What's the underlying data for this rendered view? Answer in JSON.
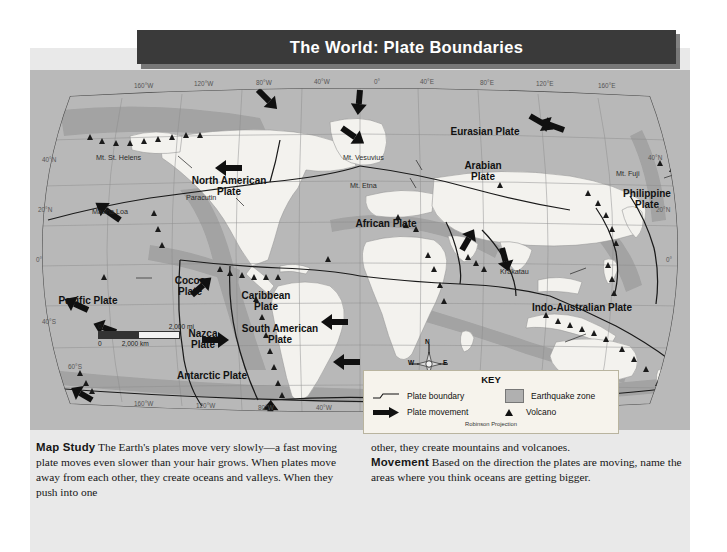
{
  "title": "The World: Plate Boundaries",
  "map": {
    "projection_note": "Robinson Projection",
    "plates": [
      {
        "name": "North American\nPlate",
        "x": 196,
        "y": 136
      },
      {
        "name": "Pacific Plate",
        "x": 56,
        "y": 228
      },
      {
        "name": "Cocos\nPlate",
        "x": 166,
        "y": 215
      },
      {
        "name": "Caribbean\nPlate",
        "x": 240,
        "y": 230
      },
      {
        "name": "Nazca\nPlate",
        "x": 181,
        "y": 266
      },
      {
        "name": "South American\nPlate",
        "x": 249,
        "y": 261
      },
      {
        "name": "African Plate",
        "x": 358,
        "y": 224
      },
      {
        "name": "Eurasian Plate",
        "x": 455,
        "y": 132
      },
      {
        "name": "Arabian\nPlate",
        "x": 455,
        "y": 169
      },
      {
        "name": "Philippine\nPlate",
        "x": 618,
        "y": 193
      },
      {
        "name": "Indo-Australian Plate",
        "x": 526,
        "y": 295
      },
      {
        "name": "Antarctic Plate",
        "x": 173,
        "y": 374
      }
    ],
    "volcano_labels": [
      {
        "name": "Mt. St. Helens",
        "x": 98,
        "y": 152
      },
      {
        "name": "Mauna Loa",
        "x": 96,
        "y": 207
      },
      {
        "name": "Paracutin",
        "x": 186,
        "y": 194
      },
      {
        "name": "Mt. Vesuvius",
        "x": 347,
        "y": 152
      },
      {
        "name": "Mt. Etna",
        "x": 353,
        "y": 181
      },
      {
        "name": "Mt. Fuji",
        "x": 617,
        "y": 169
      },
      {
        "name": "Krakatau",
        "x": 506,
        "y": 269
      }
    ],
    "longitude_top": [
      "160°W",
      "120°W",
      "80°W",
      "40°W",
      "0°",
      "40°E",
      "80°E",
      "120°E",
      "160°E"
    ],
    "longitude_bottom": [
      "160°W",
      "120°W",
      "80°W",
      "40°W"
    ],
    "latitude_left": [
      "40°N",
      "20°N",
      "0°",
      "40°S",
      "60°S"
    ],
    "latitude_right": [
      "40°N",
      "20°N",
      "0°"
    ],
    "compass": {
      "n": "N",
      "s": "S",
      "e": "E",
      "w": "W"
    },
    "scale": {
      "miles_zero": "0",
      "miles_value": "2,000 mi",
      "km_zero": "0",
      "km_value": "2,000 km"
    }
  },
  "key": {
    "title": "KEY",
    "items": [
      {
        "label": "Plate boundary",
        "icon": "boundary-line-icon"
      },
      {
        "label": "Earthquake zone",
        "icon": "earthquake-swatch-icon"
      },
      {
        "label": "Plate movement",
        "icon": "arrow-icon"
      },
      {
        "label": "Volcano",
        "icon": "volcano-triangle-icon"
      }
    ],
    "projection": "Robinson Projection"
  },
  "bottom": {
    "col1_lead": "Map Study",
    "col1_text": "  The Earth's plates move very slowly—a fast moving plate moves even slower than your hair grows. When plates move away from each other, they create oceans and valleys. When they push into one",
    "col2_pre": "other, they create mountains and volcanoes.",
    "col2_lead": "Movement",
    "col2_text": "  Based on the direction the plates are moving, name the areas where you think oceans are getting bigger."
  },
  "colors": {
    "title_bar": "#3a3a3a",
    "map_field": "#b9b9b9",
    "land": "#f2f2ee",
    "quake_zone": "#a3a3a3",
    "panel": "#e9e9e9",
    "key_bg": "#f6f3ec"
  }
}
